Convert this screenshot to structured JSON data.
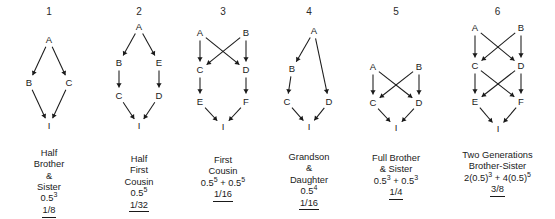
{
  "figure": {
    "background": "#ffffff",
    "line_color": "#1a1a1a"
  },
  "panels": [
    {
      "number": "1",
      "caption_lines": [
        "Half",
        "Brother",
        "&",
        "Sister"
      ],
      "formula": "0.5",
      "formula_exp": "3",
      "result": "1/8",
      "nodes": [
        {
          "id": "A",
          "label": "A",
          "x": 40,
          "y": 18
        },
        {
          "id": "B",
          "label": "B",
          "x": 20,
          "y": 61
        },
        {
          "id": "C",
          "label": "C",
          "x": 60,
          "y": 61
        },
        {
          "id": "I",
          "label": "I",
          "x": 40,
          "y": 104
        }
      ],
      "edges": [
        [
          "A",
          "B"
        ],
        [
          "A",
          "C"
        ],
        [
          "B",
          "I"
        ],
        [
          "C",
          "I"
        ]
      ],
      "svg_w": 80,
      "svg_h": 120,
      "left": 0,
      "width": 98,
      "caption_top": 148
    },
    {
      "number": "2",
      "caption_lines": [
        "Half",
        "First",
        "Cousin"
      ],
      "formula": "0.5",
      "formula_exp": "5",
      "result": "1/32",
      "nodes": [
        {
          "id": "A",
          "label": "A",
          "x": 33,
          "y": 5
        },
        {
          "id": "B",
          "label": "B",
          "x": 13,
          "y": 41
        },
        {
          "id": "E",
          "label": "E",
          "x": 53,
          "y": 41
        },
        {
          "id": "C",
          "label": "C",
          "x": 13,
          "y": 74
        },
        {
          "id": "D",
          "label": "D",
          "x": 53,
          "y": 74
        },
        {
          "id": "I",
          "label": "I",
          "x": 33,
          "y": 104
        }
      ],
      "edges": [
        [
          "A",
          "B"
        ],
        [
          "A",
          "E"
        ],
        [
          "B",
          "C"
        ],
        [
          "E",
          "D"
        ],
        [
          "C",
          "I"
        ],
        [
          "D",
          "I"
        ]
      ],
      "svg_w": 66,
      "svg_h": 120,
      "left": 98,
      "width": 82,
      "caption_top": 154
    },
    {
      "number": "3",
      "caption_lines": [
        "First",
        "Cousin"
      ],
      "formula": "0.5",
      "formula_exp": "5",
      "formula2": "0.5",
      "formula2_exp": "5",
      "result": "1/16",
      "nodes": [
        {
          "id": "A",
          "label": "A",
          "x": 13,
          "y": 11
        },
        {
          "id": "B",
          "label": "B",
          "x": 59,
          "y": 11
        },
        {
          "id": "C",
          "label": "C",
          "x": 13,
          "y": 48
        },
        {
          "id": "D",
          "label": "D",
          "x": 59,
          "y": 48
        },
        {
          "id": "E",
          "label": "E",
          "x": 13,
          "y": 80
        },
        {
          "id": "F",
          "label": "F",
          "x": 59,
          "y": 80
        },
        {
          "id": "I",
          "label": "I",
          "x": 36,
          "y": 105
        }
      ],
      "edges": [
        [
          "A",
          "C"
        ],
        [
          "A",
          "D"
        ],
        [
          "B",
          "C"
        ],
        [
          "B",
          "D"
        ],
        [
          "C",
          "E"
        ],
        [
          "D",
          "F"
        ],
        [
          "E",
          "I"
        ],
        [
          "F",
          "I"
        ]
      ],
      "svg_w": 72,
      "svg_h": 120,
      "left": 180,
      "width": 86,
      "caption_top": 155
    },
    {
      "number": "4",
      "caption_lines": [
        "Grandson",
        "&",
        "Daughter"
      ],
      "formula": "0.5",
      "formula_exp": "4",
      "result": "1/16",
      "nodes": [
        {
          "id": "A",
          "label": "A",
          "x": 40,
          "y": 9
        },
        {
          "id": "B",
          "label": "B",
          "x": 18,
          "y": 47
        },
        {
          "id": "C",
          "label": "C",
          "x": 13,
          "y": 80
        },
        {
          "id": "D",
          "label": "D",
          "x": 55,
          "y": 80
        },
        {
          "id": "I",
          "label": "I",
          "x": 35,
          "y": 105
        }
      ],
      "edges": [
        [
          "A",
          "B"
        ],
        [
          "A",
          "D"
        ],
        [
          "B",
          "C"
        ],
        [
          "C",
          "I"
        ],
        [
          "D",
          "I"
        ]
      ],
      "svg_w": 70,
      "svg_h": 120,
      "left": 266,
      "width": 86,
      "caption_top": 152
    },
    {
      "number": "5",
      "caption_lines": [
        "Full Brother",
        "& Sister"
      ],
      "formula": "0.5",
      "formula_exp": "3",
      "formula2": "0.5",
      "formula2_exp": "3",
      "result": "1/4",
      "nodes": [
        {
          "id": "A",
          "label": "A",
          "x": 13,
          "y": 45
        },
        {
          "id": "B",
          "label": "B",
          "x": 59,
          "y": 45
        },
        {
          "id": "C",
          "label": "C",
          "x": 13,
          "y": 81
        },
        {
          "id": "D",
          "label": "D",
          "x": 59,
          "y": 81
        },
        {
          "id": "I",
          "label": "I",
          "x": 36,
          "y": 106
        }
      ],
      "edges": [
        [
          "A",
          "C"
        ],
        [
          "A",
          "D"
        ],
        [
          "B",
          "C"
        ],
        [
          "B",
          "D"
        ],
        [
          "C",
          "I"
        ],
        [
          "D",
          "I"
        ]
      ],
      "svg_w": 72,
      "svg_h": 120,
      "left": 352,
      "width": 88,
      "caption_top": 153
    },
    {
      "number": "6",
      "caption_lines": [
        "Two Generations",
        "Brother-Sister"
      ],
      "formula_full": "2(0.5)",
      "formula_full_exp": "3",
      "formula_full2": "4(0.5)",
      "formula_full2_exp": "5",
      "result": "3/8",
      "nodes": [
        {
          "id": "A",
          "label": "A",
          "x": 13,
          "y": 6
        },
        {
          "id": "B",
          "label": "B",
          "x": 59,
          "y": 6
        },
        {
          "id": "C",
          "label": "C",
          "x": 13,
          "y": 44
        },
        {
          "id": "D",
          "label": "D",
          "x": 59,
          "y": 44
        },
        {
          "id": "E",
          "label": "E",
          "x": 13,
          "y": 80
        },
        {
          "id": "F",
          "label": "F",
          "x": 59,
          "y": 80
        },
        {
          "id": "I",
          "label": "I",
          "x": 36,
          "y": 107
        }
      ],
      "edges": [
        [
          "A",
          "C"
        ],
        [
          "A",
          "D"
        ],
        [
          "B",
          "C"
        ],
        [
          "B",
          "D"
        ],
        [
          "C",
          "E"
        ],
        [
          "C",
          "F"
        ],
        [
          "D",
          "E"
        ],
        [
          "D",
          "F"
        ],
        [
          "E",
          "I"
        ],
        [
          "F",
          "I"
        ]
      ],
      "svg_w": 72,
      "svg_h": 120,
      "left": 440,
      "width": 115,
      "caption_top": 150
    }
  ]
}
